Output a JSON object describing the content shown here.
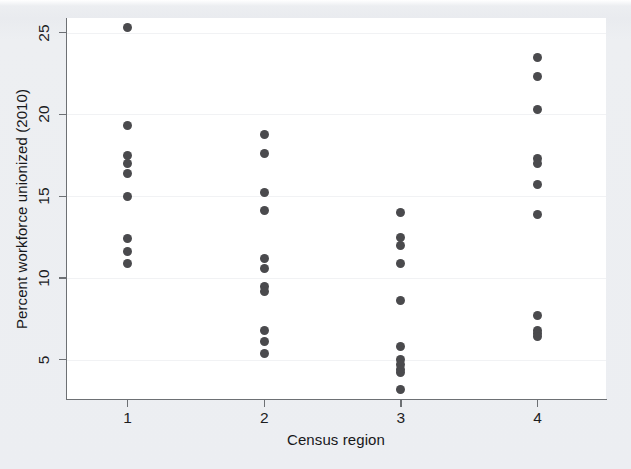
{
  "figure": {
    "background_color": "#e8eaee",
    "plot_background_color": "#ffffff",
    "axis_color": "#6d7074",
    "marker_color": "#4a4a4d"
  },
  "chart_data": {
    "type": "scatter",
    "title": "",
    "xlabel": "Census region",
    "ylabel": "Percent workforce unionized (2010)",
    "xlim": [
      0.55,
      4.5
    ],
    "ylim": [
      2.6,
      25.9
    ],
    "xticks": [
      1,
      2,
      3,
      4
    ],
    "xtick_labels": [
      "1",
      "2",
      "3",
      "4"
    ],
    "yticks": [
      5,
      10,
      15,
      20,
      25
    ],
    "ytick_labels": [
      "5",
      "10",
      "15",
      "20",
      "25"
    ],
    "grid": "horizontal-faint",
    "legend": "none",
    "marker": "filled-circle",
    "series": [
      {
        "name": "Region 1",
        "x": 1,
        "values": [
          25.3,
          19.3,
          17.5,
          17.0,
          16.4,
          15.0,
          12.4,
          11.6,
          10.9
        ]
      },
      {
        "name": "Region 2",
        "x": 2,
        "values": [
          18.8,
          17.6,
          15.2,
          14.1,
          11.2,
          10.6,
          9.5,
          9.2,
          6.8,
          6.1,
          5.4
        ]
      },
      {
        "name": "Region 3",
        "x": 3,
        "values": [
          14.0,
          12.5,
          12.0,
          10.9,
          8.6,
          5.8,
          5.0,
          4.7,
          4.4,
          4.2,
          3.2
        ]
      },
      {
        "name": "Region 4",
        "x": 4,
        "values": [
          23.5,
          22.3,
          20.3,
          17.3,
          17.0,
          15.7,
          13.9,
          7.7,
          6.8,
          6.6,
          6.4
        ]
      }
    ]
  }
}
